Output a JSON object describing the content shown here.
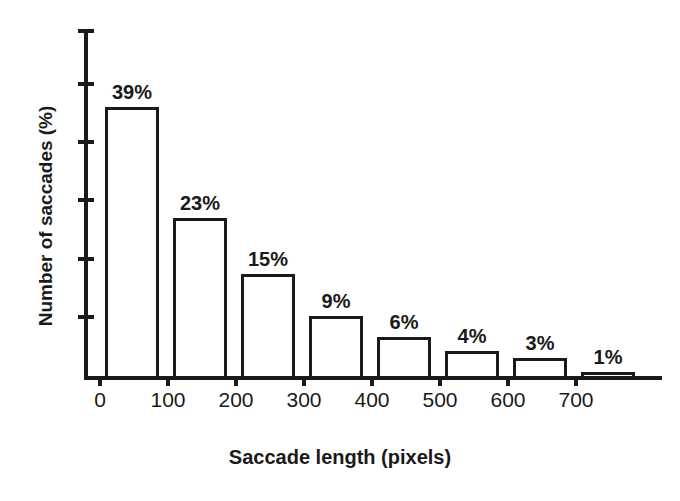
{
  "chart_data": {
    "type": "bar",
    "title": "",
    "xlabel": "Saccade length (pixels)",
    "ylabel": "Number of saccades (%)",
    "categories": [
      "0-100",
      "100-200",
      "200-300",
      "300-400",
      "400-500",
      "500-600",
      "600-700",
      "700-800"
    ],
    "values": [
      39,
      23,
      15,
      9,
      6,
      4,
      3,
      1
    ],
    "data_labels": [
      "39%",
      "23%",
      "15%",
      "9%",
      "6%",
      "4%",
      "3%",
      "1%"
    ],
    "x_tick_labels": [
      "0",
      "100",
      "200",
      "300",
      "400",
      "500",
      "600",
      "700"
    ],
    "x_tick_values": [
      0,
      100,
      200,
      300,
      400,
      500,
      600,
      700
    ],
    "y_tick_labels": [],
    "y_tick_count": 6,
    "xlim": [
      0,
      800
    ],
    "ylim": [
      0,
      50
    ],
    "grid": false,
    "legend": null,
    "bar_fill_color": "#ffffff",
    "bar_edge_color": "#1a1a1a",
    "axis_color": "#1a1a1a",
    "background_color": "#ffffff"
  }
}
